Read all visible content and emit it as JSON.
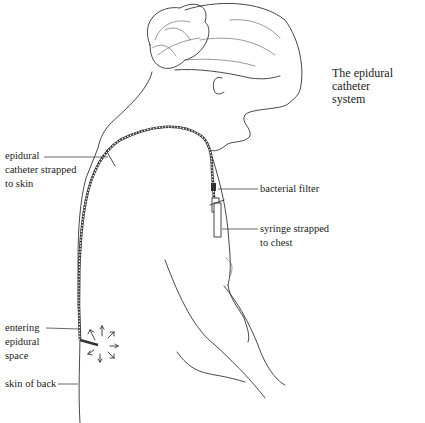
{
  "title": "The epidural catheter system",
  "title_lines": [
    "The epidural catheter",
    "system"
  ],
  "labels": {
    "catheter_strapped": [
      "epidural",
      "catheter strapped",
      "to skin"
    ],
    "bacterial_filter": "bacterial filter",
    "syringe": [
      "syringe strapped",
      "to chest"
    ],
    "entering_space": [
      "entering",
      "epidural",
      "space"
    ],
    "skin_of_back": "skin of back"
  },
  "colors": {
    "line": "#333333",
    "background": "#ffffff"
  }
}
